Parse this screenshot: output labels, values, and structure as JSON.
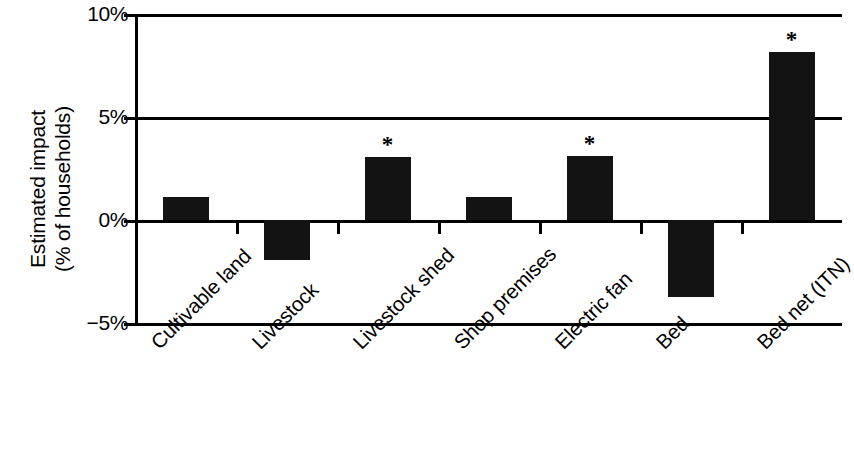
{
  "chart_data": {
    "type": "bar",
    "title": "",
    "xlabel": "",
    "ylabel": "Estimated impact\n(% of households)",
    "ylabel_line1": "Estimated impact",
    "ylabel_line2": "(% of households)",
    "categories": [
      "Cultivable land",
      "Livestock",
      "Livestock shed",
      "Shop premises",
      "Electric fan",
      "Bed",
      "Bed net (ITN)"
    ],
    "values": [
      1.1,
      -1.95,
      3.05,
      1.1,
      3.1,
      -3.75,
      8.15
    ],
    "significance": [
      "",
      "",
      "*",
      "",
      "*",
      "",
      "*"
    ],
    "ylim": [
      -5,
      10
    ],
    "yticks": [
      10,
      5,
      0,
      -5
    ],
    "ytick_labels": [
      "10%",
      "5%",
      "0%",
      "−5%"
    ],
    "grid": true,
    "legend": "none",
    "bar_color": "#131313",
    "axis_color": "#000000",
    "background": "#ffffff",
    "significance_marker": "*"
  },
  "axis": {
    "y_title_line1": "Estimated impact",
    "y_title_line2": "(% of households)"
  },
  "y_ticks": [
    {
      "label": "10%",
      "value": 10
    },
    {
      "label": "5%",
      "value": 5
    },
    {
      "label": "0%",
      "value": 0
    },
    {
      "label": "−5%",
      "value": -5
    }
  ],
  "bars": [
    {
      "label": "Cultivable land",
      "value": 1.1,
      "star": ""
    },
    {
      "label": "Livestock",
      "value": -1.95,
      "star": ""
    },
    {
      "label": "Livestock shed",
      "value": 3.05,
      "star": "*"
    },
    {
      "label": "Shop premises",
      "value": 1.1,
      "star": ""
    },
    {
      "label": "Electric fan",
      "value": 3.1,
      "star": "*"
    },
    {
      "label": "Bed",
      "value": -3.75,
      "star": ""
    },
    {
      "label": "Bed net (ITN)",
      "value": 8.15,
      "star": "*"
    }
  ]
}
